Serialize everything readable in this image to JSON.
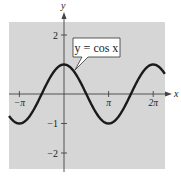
{
  "chart_data": {
    "type": "line",
    "title": "",
    "xlabel": "x",
    "ylabel": "y",
    "function": "cos(x)",
    "annotation": "y = cos x",
    "x_ticks": [
      {
        "value": -3.14159,
        "label": "−π"
      },
      {
        "value": 3.14159,
        "label": "π"
      },
      {
        "value": 6.28319,
        "label": "2π"
      }
    ],
    "y_ticks": [
      {
        "value": 2,
        "label": "2"
      },
      {
        "value": -1,
        "label": "−1"
      },
      {
        "value": -2,
        "label": "−2"
      }
    ],
    "xlim": [
      -3.87,
      7.1
    ],
    "ylim": [
      -2.5,
      2.45
    ],
    "grid": false,
    "background": "#d6d6d6",
    "line_color": "#1a1a1a",
    "series": [
      {
        "name": "y = cos x",
        "x": [
          -3.87,
          -3.14159,
          -2.356,
          -1.5708,
          -0.785,
          0,
          0.785,
          1.5708,
          2.356,
          3.14159,
          3.927,
          4.712,
          5.498,
          6.28319,
          7.1
        ],
        "y": [
          -0.74,
          -1,
          -0.707,
          0,
          0.707,
          1,
          0.707,
          0,
          -0.707,
          -1,
          -0.707,
          0,
          0.707,
          1,
          0.68
        ]
      }
    ]
  }
}
